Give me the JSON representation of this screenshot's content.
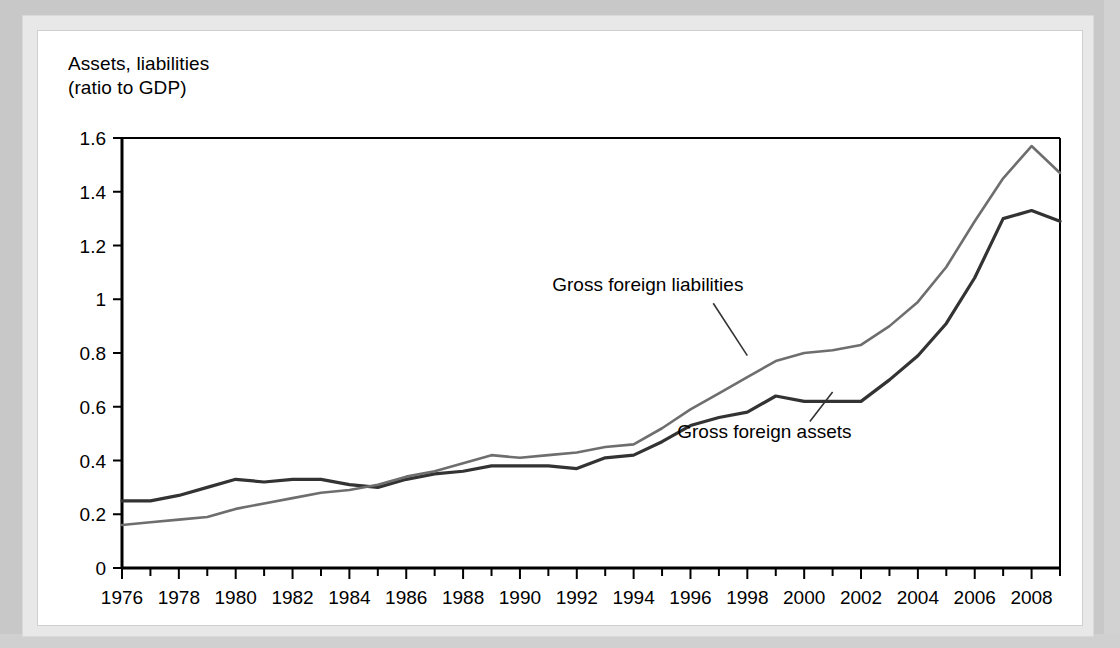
{
  "axis_title": "Assets, liabilities\n(ratio to GDP)",
  "colors": {
    "assets_line": "#333333",
    "liabilities_line": "#6e6e6e",
    "axis": "#000000",
    "panel_background": "#ffffff",
    "mat_background": "#c8c8c8"
  },
  "chart_data": {
    "type": "line",
    "title": "",
    "subtitle": "",
    "xlabel": "",
    "ylabel": "Assets, liabilities (ratio to GDP)",
    "xlim": [
      1976,
      2009
    ],
    "ylim": [
      0,
      1.6
    ],
    "grid": false,
    "legend_position": "inline-annotations",
    "y_ticks": [
      "0",
      "0.2",
      "0.4",
      "0.6",
      "0.8",
      "1",
      "1.2",
      "1.4",
      "1.6"
    ],
    "y_tick_values": [
      0,
      0.2,
      0.4,
      0.6,
      0.8,
      1.0,
      1.2,
      1.4,
      1.6
    ],
    "x_ticks": [
      "1976",
      "1978",
      "1980",
      "1982",
      "1984",
      "1986",
      "1988",
      "1990",
      "1992",
      "1994",
      "1996",
      "1998",
      "2000",
      "2002",
      "2004",
      "2006",
      "2008"
    ],
    "x_tick_values": [
      1976,
      1978,
      1980,
      1982,
      1984,
      1986,
      1988,
      1990,
      1992,
      1994,
      1996,
      1998,
      2000,
      2002,
      2004,
      2006,
      2008
    ],
    "x_minor_step": 1,
    "x": [
      1976,
      1977,
      1978,
      1979,
      1980,
      1981,
      1982,
      1983,
      1984,
      1985,
      1986,
      1987,
      1988,
      1989,
      1990,
      1991,
      1992,
      1993,
      1994,
      1995,
      1996,
      1997,
      1998,
      1999,
      2000,
      2001,
      2002,
      2003,
      2004,
      2005,
      2006,
      2007,
      2008,
      2009
    ],
    "series": [
      {
        "name": "Gross foreign assets",
        "color": "#333333",
        "values": [
          0.25,
          0.25,
          0.27,
          0.3,
          0.33,
          0.32,
          0.33,
          0.33,
          0.31,
          0.3,
          0.33,
          0.35,
          0.36,
          0.38,
          0.38,
          0.38,
          0.37,
          0.41,
          0.42,
          0.47,
          0.53,
          0.56,
          0.58,
          0.64,
          0.62,
          0.62,
          0.62,
          0.7,
          0.79,
          0.91,
          1.08,
          1.3,
          1.33,
          1.29
        ]
      },
      {
        "name": "Gross foreign liabilities",
        "color": "#6e6e6e",
        "values": [
          0.16,
          0.17,
          0.18,
          0.19,
          0.22,
          0.24,
          0.26,
          0.28,
          0.29,
          0.31,
          0.34,
          0.36,
          0.39,
          0.42,
          0.41,
          0.42,
          0.43,
          0.45,
          0.46,
          0.52,
          0.59,
          0.65,
          0.71,
          0.77,
          0.8,
          0.81,
          0.83,
          0.9,
          0.99,
          1.12,
          1.29,
          1.45,
          1.57,
          1.47
        ]
      }
    ],
    "annotations": [
      {
        "text": "Gross foreign liabilities",
        "text_x": 1994.5,
        "text_y": 1.03,
        "leader_from_x": 1996.8,
        "leader_from_y": 0.985,
        "leader_to_x": 1998.0,
        "leader_to_y": 0.79
      },
      {
        "text": "Gross foreign assets",
        "text_x": 1998.6,
        "text_y": 0.485,
        "leader_from_x": 2000.2,
        "leader_from_y": 0.545,
        "leader_to_x": 2001.0,
        "leader_to_y": 0.655
      }
    ]
  }
}
